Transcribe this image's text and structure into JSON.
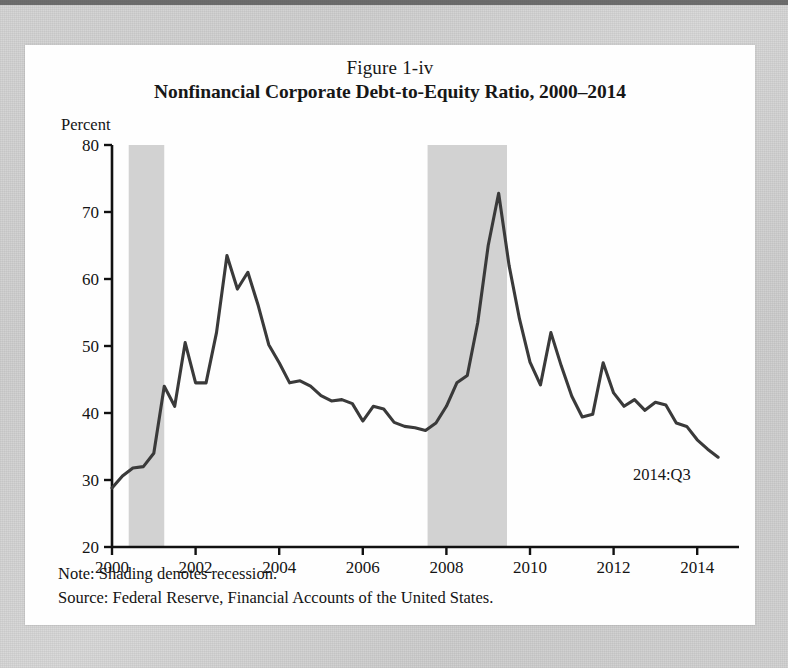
{
  "figure": {
    "number_label": "Figure 1-iv",
    "title": "Nonfinancial Corporate Debt-to-Equity Ratio, 2000–2014",
    "axis_unit_label": "Percent",
    "note": "Note: Shading denotes recession.",
    "source": "Source: Federal Reserve, Financial Accounts of the United States.",
    "end_annotation": "2014:Q3"
  },
  "colors": {
    "line": "#3a3a3a",
    "recession_band": "#d2d2d2",
    "axis": "#111111",
    "figure_background": "#fefefe",
    "page_background": "#d2d2d2"
  },
  "chart_data": {
    "type": "line",
    "title": "Nonfinancial Corporate Debt-to-Equity Ratio, 2000–2014",
    "subtitle": "Figure 1-iv",
    "xlabel": "",
    "ylabel": "Percent",
    "xlim": [
      2000,
      2015
    ],
    "ylim": [
      20,
      80
    ],
    "ytick_labels": [
      "20",
      "30",
      "40",
      "50",
      "60",
      "70",
      "80"
    ],
    "yticks": [
      20,
      30,
      40,
      50,
      60,
      70,
      80
    ],
    "xtick_labels": [
      "2000",
      "2002",
      "2004",
      "2006",
      "2008",
      "2010",
      "2012",
      "2014"
    ],
    "xticks": [
      2000,
      2002,
      2004,
      2006,
      2008,
      2010,
      2012,
      2014
    ],
    "grid": false,
    "legend": false,
    "annotations": [
      {
        "text": "2014:Q3",
        "x": 2013.6,
        "y": 29.0
      }
    ],
    "shaded_regions": [
      {
        "label": "recession",
        "x_start": 2000.4,
        "x_end": 2001.25
      },
      {
        "label": "recession",
        "x_start": 2007.55,
        "x_end": 2009.45
      }
    ],
    "series": [
      {
        "name": "Nonfinancial corporate debt-to-equity ratio",
        "x": [
          2000.0,
          2000.25,
          2000.5,
          2000.75,
          2001.0,
          2001.25,
          2001.5,
          2001.75,
          2002.0,
          2002.25,
          2002.5,
          2002.75,
          2003.0,
          2003.25,
          2003.5,
          2003.75,
          2004.0,
          2004.25,
          2004.5,
          2004.75,
          2005.0,
          2005.25,
          2005.5,
          2005.75,
          2006.0,
          2006.25,
          2006.5,
          2006.75,
          2007.0,
          2007.25,
          2007.5,
          2007.75,
          2008.0,
          2008.25,
          2008.5,
          2008.75,
          2009.0,
          2009.25,
          2009.5,
          2009.75,
          2010.0,
          2010.25,
          2010.5,
          2010.75,
          2011.0,
          2011.25,
          2011.5,
          2011.75,
          2012.0,
          2012.25,
          2012.5,
          2012.75,
          2013.0,
          2013.25,
          2013.5,
          2013.75,
          2014.0,
          2014.25,
          2014.5
        ],
        "y": [
          28.8,
          30.6,
          31.8,
          32.0,
          34.0,
          44.0,
          41.0,
          50.5,
          44.5,
          44.5,
          52.0,
          63.5,
          58.5,
          61.0,
          56.0,
          50.2,
          47.5,
          44.5,
          44.8,
          44.0,
          42.6,
          41.8,
          42.0,
          41.4,
          38.8,
          41.0,
          40.6,
          38.6,
          38.0,
          37.8,
          37.4,
          38.5,
          41.0,
          44.5,
          45.6,
          53.5,
          65.0,
          72.8,
          62.0,
          54.0,
          47.6,
          44.2,
          52.0,
          47.0,
          42.5,
          39.4,
          39.8,
          47.5,
          43.0,
          41.0,
          42.0,
          40.4,
          41.6,
          41.2,
          38.5,
          38.0,
          36.0,
          34.6,
          33.4
        ]
      }
    ]
  }
}
